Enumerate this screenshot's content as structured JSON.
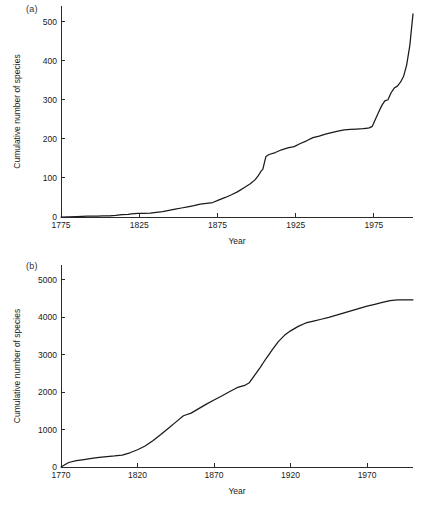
{
  "figure": {
    "background": "#ffffff",
    "line_color": "#1a1a1a",
    "text_color": "#1a1a1a"
  },
  "panels": {
    "a": {
      "label": "(a)"
    },
    "b": {
      "label": "(b)"
    }
  },
  "chart_data": [
    {
      "type": "line",
      "panel": "(a)",
      "title": "",
      "xlabel": "Year",
      "ylabel": "Cumulative number of species",
      "xlim": [
        1775,
        2000
      ],
      "ylim": [
        0,
        540
      ],
      "xticks": [
        1775,
        1825,
        1875,
        1925,
        1975
      ],
      "xtick_labels": [
        "1775",
        "1825",
        "1875",
        "1925",
        "1975"
      ],
      "yticks": [
        0,
        100,
        200,
        300,
        400,
        500
      ],
      "ytick_labels": [
        "0",
        "100",
        "200",
        "300",
        "400",
        "500"
      ],
      "grid": false,
      "legend": "none",
      "series": [
        {
          "name": "Cumulative species (a)",
          "x": [
            1775,
            1785,
            1792,
            1798,
            1802,
            1806,
            1810,
            1814,
            1818,
            1820,
            1824,
            1828,
            1832,
            1836,
            1840,
            1844,
            1848,
            1852,
            1856,
            1860,
            1864,
            1868,
            1872,
            1876,
            1880,
            1884,
            1888,
            1892,
            1896,
            1899,
            1901,
            1903,
            1904,
            1906,
            1908,
            1912,
            1916,
            1920,
            1924,
            1928,
            1932,
            1936,
            1940,
            1944,
            1948,
            1952,
            1956,
            1960,
            1964,
            1968,
            1970,
            1972,
            1974,
            1976,
            1978,
            1980,
            1982,
            1984,
            1986,
            1988,
            1990,
            1992,
            1994,
            1996,
            1998,
            2000
          ],
          "y": [
            0,
            1,
            2,
            2,
            3,
            3,
            4,
            6,
            7,
            8,
            9,
            9,
            10,
            12,
            14,
            17,
            20,
            23,
            26,
            29,
            33,
            35,
            37,
            44,
            50,
            57,
            65,
            75,
            85,
            95,
            105,
            118,
            122,
            155,
            160,
            165,
            172,
            177,
            180,
            188,
            195,
            203,
            207,
            212,
            216,
            220,
            223,
            224,
            225,
            226,
            227,
            228,
            232,
            250,
            268,
            285,
            297,
            300,
            318,
            330,
            335,
            345,
            360,
            390,
            440,
            520
          ]
        }
      ]
    },
    {
      "type": "line",
      "panel": "(b)",
      "title": "",
      "xlabel": "Year",
      "ylabel": "Cumulative number of species",
      "xlim": [
        1770,
        2000
      ],
      "ylim": [
        0,
        5400
      ],
      "xticks": [
        1770,
        1820,
        1870,
        1920,
        1970
      ],
      "xtick_labels": [
        "1770",
        "1820",
        "1870",
        "1920",
        "1970"
      ],
      "yticks": [
        0,
        1000,
        2000,
        3000,
        4000,
        5000
      ],
      "ytick_labels": [
        "0",
        "1000",
        "2000",
        "3000",
        "4000",
        "5000"
      ],
      "grid": false,
      "legend": "none",
      "series": [
        {
          "name": "Cumulative species (b)",
          "x": [
            1770,
            1775,
            1780,
            1785,
            1790,
            1795,
            1800,
            1805,
            1810,
            1815,
            1820,
            1825,
            1830,
            1835,
            1840,
            1845,
            1850,
            1855,
            1860,
            1865,
            1870,
            1875,
            1880,
            1885,
            1890,
            1893,
            1896,
            1900,
            1904,
            1908,
            1912,
            1916,
            1920,
            1925,
            1930,
            1935,
            1940,
            1945,
            1950,
            1955,
            1960,
            1965,
            1970,
            1975,
            1980,
            1985,
            1990,
            1995,
            2000
          ],
          "y": [
            0,
            120,
            170,
            200,
            230,
            255,
            275,
            295,
            320,
            380,
            460,
            560,
            700,
            860,
            1030,
            1200,
            1370,
            1440,
            1560,
            1680,
            1790,
            1900,
            2010,
            2120,
            2180,
            2250,
            2420,
            2650,
            2900,
            3130,
            3350,
            3520,
            3640,
            3760,
            3850,
            3900,
            3950,
            4000,
            4060,
            4120,
            4180,
            4240,
            4300,
            4350,
            4400,
            4450,
            4470,
            4470,
            4470
          ]
        }
      ]
    }
  ]
}
